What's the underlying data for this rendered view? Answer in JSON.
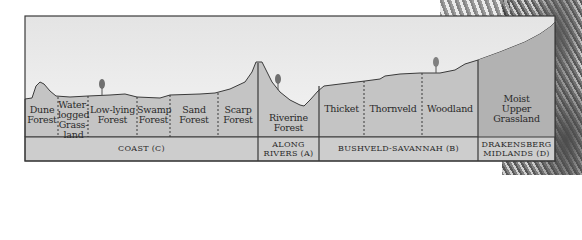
{
  "colors": {
    "sky_top": "#e6e6e6",
    "sky_bottom": "#f4f4f4",
    "land": "#c4c4c4",
    "land_dark": "#b4b4b4",
    "band": "#cdcdcd",
    "line": "#3a3a3a"
  },
  "zones": [
    {
      "label": "Dune Forest"
    },
    {
      "label": "Water-logged Grass-land"
    },
    {
      "label": "Low-lying Forest"
    },
    {
      "label": "Swamp Forest"
    },
    {
      "label": "Sand Forest"
    },
    {
      "label": "Scarp Forest"
    },
    {
      "label": "Riverine Forest"
    },
    {
      "label": "Thicket"
    },
    {
      "label": "Thornveld"
    },
    {
      "label": "Woodland"
    },
    {
      "label": "Moist Upper Grassland"
    }
  ],
  "zone_lines": {
    "z0": [
      "Dune",
      "Forest"
    ],
    "z1": [
      "Water-",
      "logged",
      "Grass-",
      "land"
    ],
    "z2": [
      "Low-lying",
      "Forest"
    ],
    "z3": [
      "Swamp",
      "Forest"
    ],
    "z4": [
      "Sand",
      "Forest"
    ],
    "z5": [
      "Scarp",
      "Forest"
    ],
    "z6": [
      "Riverine",
      "Forest"
    ],
    "z7": [
      "Thicket"
    ],
    "z8": [
      "Thornveld"
    ],
    "z9": [
      "Woodland"
    ],
    "z10": [
      "Moist",
      "Upper",
      "Grassland"
    ]
  },
  "regions": [
    {
      "label": "COAST (C)"
    },
    {
      "label_lines": [
        "ALONG",
        "RIVERS (A)"
      ]
    },
    {
      "label": "BUSHVELD-SAVANNAH (B)"
    },
    {
      "label_lines": [
        "DRAKENSBERG",
        "MIDLANDS (D)"
      ]
    }
  ],
  "icons": [
    "tree-icon",
    "tree-icon",
    "tree-icon"
  ]
}
